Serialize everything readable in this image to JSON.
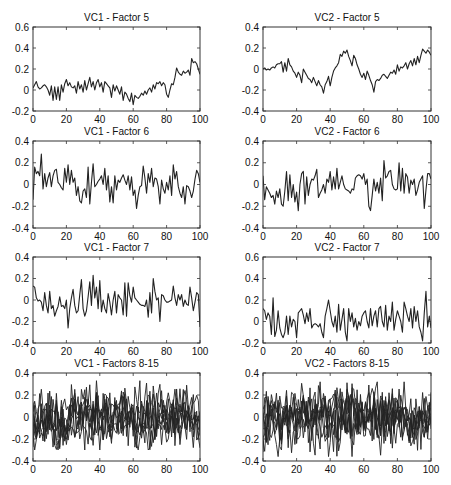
{
  "figure": {
    "background": "#ffffff",
    "line_color": "#222222",
    "axes_color": "#333333"
  },
  "chart_data": [
    {
      "type": "line",
      "title": "VC1 - Factor 5",
      "xlabel": "",
      "ylabel": "",
      "xlim": [
        0,
        100
      ],
      "ylim": [
        -0.2,
        0.6
      ],
      "xticks": [
        0,
        20,
        40,
        60,
        80,
        100
      ],
      "yticks": [
        -0.2,
        0,
        0.2,
        0.4,
        0.6
      ],
      "ytick_labels": [
        "-0.2",
        "0",
        "0.2",
        "0.4",
        "0.6"
      ],
      "grid": false,
      "box": {
        "x": 33,
        "y": 27,
        "w": 167,
        "h": 84
      },
      "series": [
        {
          "name": "Factor 5",
          "values": [
            0.02,
            0.05,
            0.08,
            0.03,
            0.01,
            0.02,
            0.04,
            0.05,
            0.03,
            0.0,
            -0.05,
            0.04,
            -0.1,
            0.03,
            -0.09,
            0.03,
            -0.1,
            0.05,
            -0.02,
            0.06,
            0.1,
            0.04,
            0.07,
            0.03,
            0.02,
            0.04,
            -0.03,
            0.08,
            0.01,
            0.05,
            -0.02,
            0.09,
            0.0,
            0.06,
            0.12,
            0.03,
            0.08,
            0.0,
            0.07,
            0.1,
            0.03,
            0.07,
            -0.02,
            0.08,
            0.06,
            0.04,
            0.02,
            -0.07,
            0.05,
            -0.01,
            0.04,
            0.0,
            -0.04,
            0.03,
            -0.1,
            -0.02,
            -0.04,
            -0.08,
            -0.11,
            -0.03,
            -0.14,
            -0.05,
            -0.07,
            -0.08,
            -0.06,
            -0.03,
            -0.05,
            -0.01,
            -0.04,
            0.0,
            0.02,
            -0.02,
            0.05,
            0.01,
            0.07,
            0.06,
            0.08,
            0.04,
            0.07,
            0.05,
            -0.04,
            -0.07,
            0.0,
            0.06,
            0.05,
            0.12,
            0.21,
            0.17,
            0.15,
            0.14,
            0.18,
            0.16,
            0.17,
            0.19,
            0.14,
            0.3,
            0.26,
            0.27,
            0.25,
            0.2,
            0.15
          ]
        }
      ]
    },
    {
      "type": "line",
      "title": "VC2 - Factor 5",
      "xlabel": "",
      "ylabel": "",
      "xlim": [
        0,
        100
      ],
      "ylim": [
        -0.4,
        0.4
      ],
      "xticks": [
        0,
        20,
        40,
        60,
        80,
        100
      ],
      "yticks": [
        -0.4,
        -0.2,
        0,
        0.2,
        0.4
      ],
      "ytick_labels": [
        "-0.4",
        "-0.2",
        "0",
        "0.2",
        "0.4"
      ],
      "grid": false,
      "box": {
        "x": 263,
        "y": 27,
        "w": 168,
        "h": 84
      },
      "series": [
        {
          "name": "Factor 5",
          "values": [
            0.0,
            0.01,
            -0.01,
            0.0,
            -0.01,
            0.01,
            0.02,
            0.01,
            0.04,
            0.05,
            0.05,
            0.07,
            -0.03,
            0.06,
            -0.02,
            0.1,
            0.04,
            0.02,
            -0.02,
            -0.04,
            -0.08,
            -0.03,
            -0.06,
            -0.13,
            0.0,
            -0.03,
            -0.06,
            -0.09,
            -0.1,
            -0.13,
            -0.08,
            -0.12,
            -0.16,
            -0.11,
            -0.15,
            -0.17,
            -0.23,
            -0.15,
            -0.12,
            -0.07,
            -0.16,
            -0.08,
            -0.02,
            0.01,
            0.03,
            0.06,
            0.14,
            0.12,
            0.17,
            0.15,
            0.18,
            0.12,
            0.08,
            0.03,
            0.13,
            0.1,
            0.04,
            0.0,
            -0.05,
            -0.08,
            -0.04,
            -0.1,
            -0.02,
            -0.06,
            -0.11,
            -0.15,
            -0.22,
            -0.12,
            -0.1,
            -0.11,
            -0.09,
            -0.06,
            -0.05,
            -0.07,
            -0.09,
            -0.06,
            -0.03,
            -0.04,
            -0.01,
            -0.05,
            0.04,
            -0.02,
            0.02,
            0.01,
            0.03,
            0.06,
            0.0,
            0.05,
            0.08,
            0.03,
            0.1,
            0.04,
            0.12,
            0.06,
            0.13,
            0.19,
            0.17,
            0.15,
            0.18,
            0.16,
            0.13
          ]
        }
      ]
    },
    {
      "type": "line",
      "title": "VC1 - Factor 6",
      "xlabel": "",
      "ylabel": "",
      "xlim": [
        0,
        100
      ],
      "ylim": [
        -0.4,
        0.4
      ],
      "xticks": [
        0,
        20,
        40,
        60,
        80,
        100
      ],
      "yticks": [
        -0.4,
        -0.2,
        0,
        0.2,
        0.4
      ],
      "ytick_labels": [
        "-0.4",
        "-0.2",
        "0",
        "0.2",
        "0.4"
      ],
      "grid": false,
      "box": {
        "x": 33,
        "y": 141,
        "w": 167,
        "h": 87
      },
      "series": [
        {
          "name": "Factor 6",
          "values": [
            -0.14,
            0.16,
            0.1,
            0.12,
            0.08,
            0.28,
            -0.04,
            0.1,
            -0.02,
            0.06,
            0.11,
            -0.02,
            0.08,
            0.13,
            0.14,
            0.02,
            0.0,
            -0.03,
            -0.05,
            0.15,
            0.02,
            0.18,
            0.0,
            0.13,
            0.02,
            0.06,
            -0.1,
            -0.02,
            -0.15,
            -0.17,
            -0.06,
            -0.04,
            -0.12,
            0.16,
            -0.18,
            0.02,
            0.19,
            -0.02,
            0.0,
            0.03,
            0.05,
            0.08,
            0.0,
            0.15,
            -0.05,
            0.08,
            -0.16,
            -0.02,
            -0.17,
            0.08,
            -0.05,
            0.04,
            0.02,
            0.06,
            0.09,
            0.04,
            0.0,
            0.08,
            -0.05,
            0.07,
            -0.1,
            -0.05,
            -0.22,
            -0.1,
            -0.02,
            -0.01,
            0.17,
            0.06,
            -0.08,
            0.1,
            0.02,
            0.15,
            -0.02,
            0.06,
            0.05,
            -0.02,
            -0.18,
            0.04,
            -0.04,
            -0.08,
            0.02,
            -0.05,
            0.08,
            -0.1,
            0.18,
            0.05,
            0.12,
            -0.02,
            -0.08,
            -0.12,
            -0.02,
            -0.18,
            -0.01,
            -0.02,
            -0.06,
            -0.12,
            -0.06,
            0.05,
            0.13,
            0.1,
            0.02
          ]
        }
      ]
    },
    {
      "type": "line",
      "title": "VC2 - Factor 6",
      "xlabel": "",
      "ylabel": "",
      "xlim": [
        0,
        100
      ],
      "ylim": [
        -0.4,
        0.4
      ],
      "xticks": [
        0,
        20,
        40,
        60,
        80,
        100
      ],
      "yticks": [
        -0.4,
        -0.2,
        0,
        0.2,
        0.4
      ],
      "ytick_labels": [
        "-0.4",
        "-0.2",
        "0",
        "0.2",
        "0.4"
      ],
      "grid": false,
      "box": {
        "x": 263,
        "y": 141,
        "w": 168,
        "h": 87
      },
      "series": [
        {
          "name": "Factor 6",
          "values": [
            0.08,
            -0.14,
            -0.02,
            -0.05,
            -0.08,
            -0.12,
            -0.1,
            -0.18,
            -0.06,
            -0.12,
            -0.04,
            -0.18,
            -0.2,
            -0.06,
            0.12,
            -0.15,
            0.09,
            -0.12,
            0.0,
            -0.16,
            -0.07,
            -0.24,
            0.0,
            0.1,
            0.12,
            -0.18,
            0.07,
            -0.1,
            0.0,
            0.05,
            0.04,
            0.08,
            0.14,
            -0.12,
            -0.08,
            -0.05,
            0.0,
            -0.08,
            0.05,
            0.02,
            0.12,
            -0.05,
            0.07,
            -0.04,
            0.15,
            -0.04,
            0.02,
            0.08,
            0.0,
            -0.04,
            -0.05,
            -0.06,
            -0.08,
            -0.04,
            -0.05,
            0.06,
            0.08,
            0.09,
            0.08,
            0.05,
            0.1,
            0.0,
            0.05,
            -0.2,
            -0.24,
            -0.1,
            0.05,
            -0.06,
            0.02,
            -0.08,
            0.06,
            -0.15,
            0.22,
            0.06,
            0.08,
            0.12,
            0.13,
            0.0,
            -0.04,
            -0.05,
            -0.04,
            0.2,
            -0.06,
            0.15,
            -0.08,
            0.1,
            0.07,
            -0.08,
            0.04,
            0.0,
            0.05,
            -0.1,
            -0.05,
            0.02,
            0.05,
            0.08,
            -0.22,
            -0.05,
            0.1,
            0.1,
            0.05
          ]
        }
      ]
    },
    {
      "type": "line",
      "title": "VC1 - Factor 7",
      "xlabel": "",
      "ylabel": "",
      "xlim": [
        0,
        100
      ],
      "ylim": [
        -0.4,
        0.4
      ],
      "xticks": [
        0,
        20,
        40,
        60,
        80,
        100
      ],
      "yticks": [
        -0.4,
        -0.2,
        0,
        0.2,
        0.4
      ],
      "ytick_labels": [
        "-0.4",
        "-0.2",
        "0",
        "0.2",
        "0.4"
      ],
      "grid": false,
      "box": {
        "x": 33,
        "y": 257,
        "w": 167,
        "h": 86
      },
      "series": [
        {
          "name": "Factor 7",
          "values": [
            0.13,
            0.12,
            0.02,
            -0.01,
            0.0,
            -0.02,
            -0.1,
            0.07,
            -0.05,
            -0.12,
            0.08,
            -0.08,
            -0.05,
            -0.15,
            -0.1,
            -0.06,
            0.03,
            -0.06,
            -0.05,
            -0.08,
            0.0,
            -0.26,
            -0.08,
            0.02,
            0.1,
            -0.05,
            -0.12,
            -0.1,
            0.05,
            0.19,
            -0.08,
            -0.15,
            -0.1,
            0.03,
            0.17,
            -0.05,
            0.23,
            0.02,
            0.12,
            -0.08,
            0.18,
            -0.11,
            0.0,
            -0.08,
            -0.12,
            0.06,
            -0.02,
            -0.14,
            0.0,
            0.08,
            -0.12,
            0.05,
            0.02,
            0.0,
            -0.14,
            0.16,
            -0.15,
            0.16,
            0.04,
            -0.02,
            0.12,
            0.02,
            0.0,
            -0.02,
            -0.04,
            -0.05,
            -0.05,
            -0.06,
            0.0,
            -0.16,
            0.07,
            -0.12,
            0.2,
            0.08,
            0.0,
            0.02,
            -0.2,
            0.05,
            0.04,
            0.0,
            -0.02,
            -0.02,
            -0.01,
            0.0,
            0.13,
            0.02,
            -0.05,
            0.05,
            0.0,
            0.05,
            -0.06,
            0.0,
            -0.04,
            -0.05,
            0.12,
            0.02,
            -0.1,
            -0.02,
            0.07,
            0.05,
            -0.25
          ]
        }
      ]
    },
    {
      "type": "line",
      "title": "VC2 - Factor 7",
      "xlabel": "",
      "ylabel": "",
      "xlim": [
        0,
        100
      ],
      "ylim": [
        -0.2,
        0.6
      ],
      "xticks": [
        0,
        20,
        40,
        60,
        80,
        100
      ],
      "yticks": [
        -0.2,
        0,
        0.2,
        0.4,
        0.6
      ],
      "ytick_labels": [
        "-0.2",
        "0",
        "0.2",
        "0.4",
        "0.6"
      ],
      "grid": false,
      "box": {
        "x": 263,
        "y": 257,
        "w": 168,
        "h": 86
      },
      "series": [
        {
          "name": "Factor 7",
          "values": [
            0.12,
            0.1,
            0.02,
            0.08,
            0.05,
            -0.12,
            0.22,
            -0.14,
            -0.08,
            0.1,
            -0.06,
            -0.12,
            -0.15,
            -0.1,
            0.05,
            -0.12,
            0.05,
            -0.05,
            0.02,
            0.0,
            -0.15,
            0.08,
            0.1,
            0.12,
            0.06,
            -0.02,
            0.08,
            0.0,
            0.12,
            -0.06,
            -0.03,
            -0.02,
            -0.03,
            -0.05,
            -0.02,
            -0.1,
            -0.15,
            0.05,
            0.12,
            0.2,
            0.1,
            0.0,
            -0.05,
            0.05,
            -0.1,
            0.16,
            -0.08,
            0.02,
            0.12,
            -0.1,
            -0.18,
            0.12,
            0.0,
            0.08,
            -0.05,
            0.03,
            -0.08,
            0.0,
            -0.04,
            0.05,
            0.08,
            0.1,
            0.0,
            -0.06,
            0.12,
            -0.04,
            0.05,
            0.1,
            -0.05,
            0.12,
            0.14,
            0.0,
            -0.05,
            0.15,
            -0.08,
            0.05,
            0.0,
            0.18,
            -0.08,
            0.02,
            0.1,
            0.05,
            0.0,
            -0.1,
            0.18,
            0.12,
            0.05,
            0.0,
            0.12,
            -0.06,
            0.14,
            0.0,
            0.1,
            -0.05,
            -0.1,
            -0.18,
            0.08,
            0.28,
            -0.05,
            0.05,
            -0.06
          ]
        }
      ]
    },
    {
      "type": "line",
      "title": "VC1 - Factors 8-15",
      "xlabel": "",
      "ylabel": "",
      "xlim": [
        0,
        100
      ],
      "ylim": [
        -0.4,
        0.4
      ],
      "xticks": [
        0,
        20,
        40,
        60,
        80,
        100
      ],
      "yticks": [
        -0.4,
        -0.2,
        0,
        0.2,
        0.4
      ],
      "ytick_labels": [
        "-0.4",
        "-0.2",
        "0",
        "0.2",
        "0.4"
      ],
      "grid": false,
      "box": {
        "x": 33,
        "y": 373,
        "w": 167,
        "h": 88
      },
      "series_count": 8,
      "series_note": "8 overlapping noisy series, amplitude ~±0.3",
      "seeds": [
        11,
        23,
        37,
        41,
        53,
        67,
        79,
        83
      ],
      "amplitudes": [
        0.1,
        0.09,
        0.11,
        0.08,
        0.1,
        0.09,
        0.1,
        0.08
      ],
      "extremes": {
        "max": 0.33,
        "min": -0.3
      }
    },
    {
      "type": "line",
      "title": "VC2 - Factors 8-15",
      "xlabel": "",
      "ylabel": "",
      "xlim": [
        0,
        100
      ],
      "ylim": [
        -0.4,
        0.4
      ],
      "xticks": [
        0,
        20,
        40,
        60,
        80,
        100
      ],
      "yticks": [
        -0.4,
        -0.2,
        0,
        0.2,
        0.4
      ],
      "ytick_labels": [
        "-0.4",
        "-0.2",
        "0",
        "0.2",
        "0.4"
      ],
      "grid": false,
      "box": {
        "x": 263,
        "y": 373,
        "w": 168,
        "h": 88
      },
      "series_count": 8,
      "series_note": "8 overlapping noisy series, amplitude ~±0.35",
      "seeds": [
        7,
        19,
        31,
        43,
        59,
        61,
        71,
        97
      ],
      "amplitudes": [
        0.1,
        0.1,
        0.11,
        0.09,
        0.1,
        0.09,
        0.11,
        0.09
      ],
      "extremes": {
        "max": 0.32,
        "min": -0.36
      }
    }
  ]
}
